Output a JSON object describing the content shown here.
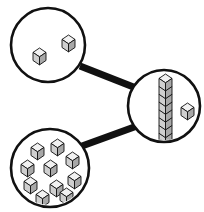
{
  "diagram": {
    "background_color": "#ffffff",
    "stroke_color": "#111111",
    "cube_top_color": "#f2f2f2",
    "cube_left_color": "#cfcfcf",
    "cube_right_color": "#a8a8a8",
    "canvas": {
      "width": 204,
      "height": 212
    },
    "nodes": [
      {
        "id": "node-loose-pair",
        "label": "two loose cubes",
        "cx": 48,
        "cy": 45,
        "r": 37,
        "count": 2,
        "contents_kind": "loose-cubes",
        "cubes": [
          {
            "x": 62,
            "y": 35,
            "size": 13
          },
          {
            "x": 33,
            "y": 48,
            "size": 13
          }
        ]
      },
      {
        "id": "node-rod-and-unit",
        "label": "rod of ten and one cube",
        "cx": 164,
        "cy": 106,
        "r": 36,
        "count": 11,
        "contents_kind": "rod-plus-loose",
        "rod": {
          "x": 159,
          "y_top": 74,
          "size": 13,
          "units": 10
        },
        "cubes": [
          {
            "x": 181,
            "y": 103,
            "size": 13
          }
        ]
      },
      {
        "id": "node-group-of-ten",
        "label": "group of ten cubes",
        "cx": 50,
        "cy": 168,
        "r": 39,
        "count": 10,
        "contents_kind": "loose-cubes",
        "cubes": [
          {
            "x": 31,
            "y": 143,
            "size": 13
          },
          {
            "x": 51,
            "y": 139,
            "size": 13
          },
          {
            "x": 66,
            "y": 152,
            "size": 13
          },
          {
            "x": 21,
            "y": 160,
            "size": 13
          },
          {
            "x": 44,
            "y": 160,
            "size": 13
          },
          {
            "x": 68,
            "y": 172,
            "size": 13
          },
          {
            "x": 24,
            "y": 177,
            "size": 13
          },
          {
            "x": 50,
            "y": 180,
            "size": 13
          },
          {
            "x": 36,
            "y": 190,
            "size": 13
          },
          {
            "x": 60,
            "y": 188,
            "size": 13
          }
        ]
      }
    ],
    "edges": [
      {
        "id": "edge-pair-to-rod",
        "label": "link from loose pair to rod",
        "x1": 80,
        "y1": 66,
        "x2": 136,
        "y2": 88,
        "width": 7
      },
      {
        "id": "edge-group-to-rod",
        "label": "link from group of ten to rod",
        "x1": 82,
        "y1": 146,
        "x2": 137,
        "y2": 126,
        "width": 7
      }
    ]
  }
}
